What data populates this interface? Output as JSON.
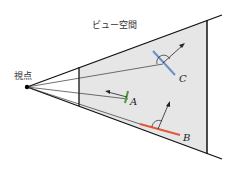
{
  "title": "ビュー空間",
  "eye_label": "視点",
  "objects": [
    {
      "label": "A",
      "color": "#4a9a3a"
    },
    {
      "label": "B",
      "color": "#e05a3a"
    },
    {
      "label": "C",
      "color": "#6a8fc8"
    }
  ],
  "colors": {
    "frustum_fill": "#e6e6e6",
    "line": "#111111"
  }
}
